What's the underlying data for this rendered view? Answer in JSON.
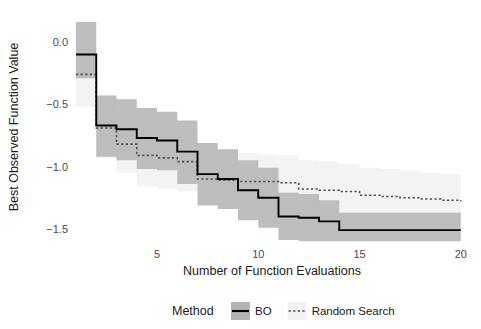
{
  "chart_data": {
    "type": "line",
    "title": "",
    "xlabel": "Number of Function Evaluations",
    "ylabel": "Best Observed Function Value",
    "xlim": [
      1,
      20
    ],
    "ylim": [
      -1.62,
      0.22
    ],
    "xticks": [
      5,
      10,
      15,
      20
    ],
    "xtick_labels": [
      "5",
      "10",
      "15",
      "20"
    ],
    "yticks": [
      0.0,
      -0.5,
      -1.0,
      -1.5
    ],
    "ytick_labels": [
      "0.0",
      "-0.5",
      "-1.0",
      "-1.5"
    ],
    "grid": false,
    "step_style": "hv",
    "legend": {
      "title": "Method",
      "position": "bottom",
      "entries": [
        {
          "name": "BO",
          "style": "solid",
          "color": "#000000",
          "key_fill": "#b3b3b3"
        },
        {
          "name": "Random Search",
          "style": "dotted",
          "color": "#4d4d4d",
          "key_fill": "#f2f2f2"
        }
      ]
    },
    "x": [
      1,
      2,
      3,
      4,
      5,
      6,
      7,
      8,
      9,
      10,
      11,
      12,
      13,
      14,
      15,
      16,
      17,
      18,
      19,
      20
    ],
    "series": [
      {
        "name": "BO",
        "style": "solid",
        "color": "#000000",
        "ribbon_color": "#b3b3b3",
        "ribbon_opacity": 0.85,
        "values": [
          -0.1,
          -0.67,
          -0.7,
          -0.77,
          -0.79,
          -0.88,
          -1.06,
          -1.1,
          -1.19,
          -1.25,
          -1.4,
          -1.41,
          -1.44,
          -1.51,
          -1.51,
          -1.51,
          -1.51,
          -1.51,
          -1.51,
          -1.51
        ],
        "lower": [
          -0.29,
          -0.92,
          -0.95,
          -1.02,
          -1.03,
          -1.14,
          -1.31,
          -1.34,
          -1.43,
          -1.49,
          -1.59,
          -1.6,
          -1.6,
          -1.6,
          -1.6,
          -1.6,
          -1.6,
          -1.6,
          -1.6,
          -1.6
        ],
        "upper": [
          0.16,
          -0.43,
          -0.46,
          -0.53,
          -0.56,
          -0.63,
          -0.81,
          -0.86,
          -0.95,
          -1.01,
          -1.21,
          -1.22,
          -1.27,
          -1.37,
          -1.37,
          -1.37,
          -1.37,
          -1.37,
          -1.37,
          -1.37
        ]
      },
      {
        "name": "Random Search",
        "style": "dotted",
        "color": "#4d4d4d",
        "ribbon_color": "#f2f2f2",
        "ribbon_opacity": 0.9,
        "values": [
          -0.26,
          -0.69,
          -0.82,
          -0.91,
          -0.93,
          -0.96,
          -1.1,
          -1.11,
          -1.12,
          -1.12,
          -1.13,
          -1.18,
          -1.19,
          -1.2,
          -1.23,
          -1.24,
          -1.25,
          -1.26,
          -1.27,
          -1.28
        ],
        "lower": [
          -0.52,
          -0.93,
          -1.05,
          -1.16,
          -1.18,
          -1.2,
          -1.32,
          -1.33,
          -1.34,
          -1.34,
          -1.36,
          -1.4,
          -1.41,
          -1.42,
          -1.44,
          -1.45,
          -1.46,
          -1.47,
          -1.48,
          -1.49
        ],
        "upper": [
          -0.01,
          -0.45,
          -0.58,
          -0.67,
          -0.69,
          -0.71,
          -0.87,
          -0.88,
          -0.89,
          -0.9,
          -0.91,
          -0.95,
          -0.96,
          -0.98,
          -1.01,
          -1.02,
          -1.03,
          -1.05,
          -1.06,
          -1.07
        ]
      }
    ]
  },
  "geometry": {
    "plot_left": 77,
    "plot_right": 468,
    "plot_top": 12,
    "plot_bottom": 241,
    "x_pixel_at_5": 157,
    "x_pixel_per_unit": 20.25,
    "y_pixel_at_0": 42,
    "y_pixel_per_half": 62.3
  }
}
